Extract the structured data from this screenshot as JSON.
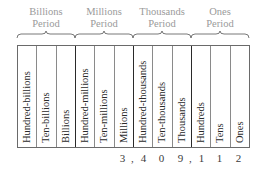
{
  "periods": [
    {
      "label_line1": "Billions",
      "label_line2": "Period"
    },
    {
      "label_line1": "Millions",
      "label_line2": "Period"
    },
    {
      "label_line1": "Thousands",
      "label_line2": "Period"
    },
    {
      "label_line1": "Ones",
      "label_line2": "Period"
    }
  ],
  "columns": [
    {
      "label": "Hundred-billions",
      "digit": ""
    },
    {
      "label": "Ten-billions",
      "digit": ""
    },
    {
      "label": "Billions",
      "digit": ""
    },
    {
      "label": "Hundred-millions",
      "digit": ""
    },
    {
      "label": "Ten-millions",
      "digit": ""
    },
    {
      "label": "Millions",
      "digit": "3"
    },
    {
      "label": "Hundred-thousands",
      "digit": "4"
    },
    {
      "label": "Ten-thousands",
      "digit": "0"
    },
    {
      "label": "Thousands",
      "digit": "9"
    },
    {
      "label": "Hundreds",
      "digit": "1"
    },
    {
      "label": "Tens",
      "digit": "1"
    },
    {
      "label": "Ones",
      "digit": "2"
    }
  ],
  "separators": [
    ",",
    ","
  ],
  "number": "3,409,112",
  "colors": {
    "period_text": "#9a9a9a",
    "column_text": "#2a2a2a",
    "border": "#6a6a6a",
    "group_border": "#2a2a2a"
  }
}
